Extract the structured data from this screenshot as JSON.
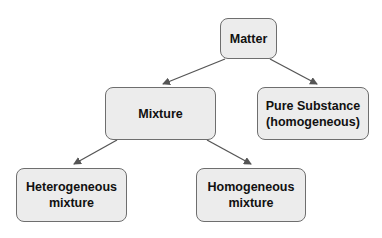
{
  "diagram": {
    "type": "hierarchy",
    "nodes": {
      "matter": {
        "label": "Matter"
      },
      "mixture": {
        "label": "Mixture"
      },
      "pure": {
        "label": "Pure Substance\n(homogeneous)"
      },
      "hetero": {
        "label": "Heterogeneous\nmixture"
      },
      "homo": {
        "label": "Homogeneous\nmixture"
      }
    },
    "edges": [
      {
        "from": "Matter",
        "to": "Mixture"
      },
      {
        "from": "Matter",
        "to": "Pure Substance (homogeneous)"
      },
      {
        "from": "Mixture",
        "to": "Heterogeneous mixture"
      },
      {
        "from": "Mixture",
        "to": "Homogeneous mixture"
      }
    ],
    "colors": {
      "node_fill": "#ececec",
      "node_border": "#6e6e6e",
      "arrow": "#555555",
      "text": "#111111"
    }
  }
}
